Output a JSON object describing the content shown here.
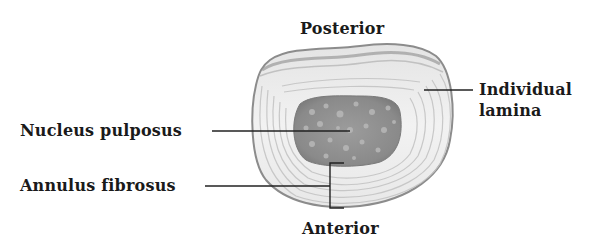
{
  "diagram": {
    "labels": {
      "posterior": "Posterior",
      "anterior": "Anterior",
      "individual_lamina_line1": "Individual",
      "individual_lamina_line2": "lamina",
      "nucleus_pulposus": "Nucleus pulposus",
      "annulus_fibrosus": "Annulus fibrosus"
    },
    "colors": {
      "background": "#ffffff",
      "text": "#1a1a1a",
      "leader_line": "#222222",
      "annulus_fill": "#efefef",
      "annulus_ring": "#bdbdbd",
      "annulus_edge": "#8c8c8c",
      "nucleus_fill": "#8e8e8e",
      "nucleus_speckle": "#b8b8b8"
    }
  }
}
